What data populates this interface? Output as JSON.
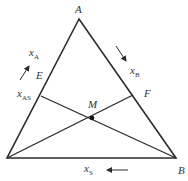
{
  "diagram": {
    "type": "ternary triangle",
    "colors": {
      "line": "#2b2b2b",
      "text": "#333333",
      "background": "#ffffff"
    },
    "vertices": {
      "A": {
        "label": "A",
        "x": 79,
        "y": 19
      },
      "S": {
        "label": "",
        "x": 7,
        "y": 158
      },
      "B": {
        "label": "B",
        "x": 176,
        "y": 158
      }
    },
    "points": {
      "E": {
        "label": "E",
        "x": 41,
        "y": 96
      },
      "F": {
        "label": "F",
        "x": 133,
        "y": 95
      },
      "M": {
        "label": "M",
        "x": 92,
        "y": 118
      }
    },
    "axis_labels": {
      "xA": {
        "main": "x",
        "sub": "A"
      },
      "xB": {
        "main": "x",
        "sub": "B"
      },
      "xAS": {
        "main": "x",
        "sub": "AS"
      },
      "xS": {
        "main": "x",
        "sub": "S"
      }
    },
    "arrows": [
      {
        "name": "arrow-xA",
        "direction": "up-right"
      },
      {
        "name": "arrow-xB",
        "direction": "down-right"
      },
      {
        "name": "arrow-xS",
        "direction": "left"
      }
    ]
  }
}
